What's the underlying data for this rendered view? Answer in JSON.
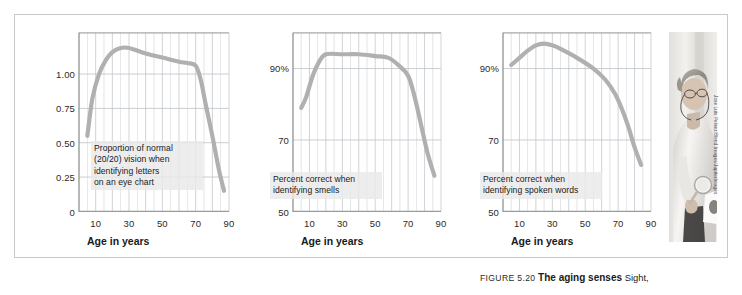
{
  "figure": {
    "caption_number": "FIGURE 5.20",
    "caption_title": "The aging senses",
    "caption_body": "Sight,",
    "photo_credit": "Jose Luis Pelaez/Blend Images/JupiterImages",
    "photo_alt": "older-woman-with-magnifier-photo",
    "grid_color": "#c4c8cc",
    "curve_color": "#b0b0b0",
    "frame_color": "#c9c9c9"
  },
  "chart_data": [
    {
      "id": "vision",
      "type": "line",
      "title": "",
      "annotation": "Proportion of normal\n(20/20) vision when\nidentifying letters\non an eye chart",
      "xlabel": "Age in years",
      "ylabel": "",
      "xlim": [
        0,
        90
      ],
      "ylim": [
        0,
        1.3
      ],
      "xticks": [
        10,
        30,
        50,
        70,
        90
      ],
      "xtick_labels": [
        "10",
        "30",
        "50",
        "70",
        "90"
      ],
      "yticks": [
        0,
        0.25,
        0.5,
        0.75,
        1.0
      ],
      "ytick_labels": [
        "0",
        "0.25",
        "0.50",
        "0.75",
        "1.00"
      ],
      "grid": true,
      "x": [
        5,
        8,
        12,
        16,
        20,
        25,
        30,
        40,
        50,
        60,
        65,
        70,
        73,
        76,
        80,
        84,
        87
      ],
      "y": [
        0.55,
        0.82,
        1.0,
        1.1,
        1.16,
        1.19,
        1.19,
        1.15,
        1.12,
        1.09,
        1.08,
        1.06,
        0.96,
        0.78,
        0.55,
        0.3,
        0.15
      ]
    },
    {
      "id": "smell",
      "type": "line",
      "title": "",
      "annotation": "Percent correct when\nidentifying smells",
      "xlabel": "Age in years",
      "ylabel": "",
      "xlim": [
        0,
        90
      ],
      "ylim": [
        50,
        100
      ],
      "xticks": [
        10,
        30,
        50,
        70,
        90
      ],
      "xtick_labels": [
        "10",
        "30",
        "50",
        "70",
        "90"
      ],
      "yticks": [
        50,
        70,
        90
      ],
      "ytick_labels": [
        "50",
        "70",
        "90%"
      ],
      "grid": true,
      "x": [
        5,
        8,
        12,
        16,
        20,
        30,
        40,
        50,
        58,
        64,
        70,
        74,
        78,
        82,
        86
      ],
      "y": [
        79,
        82,
        88,
        92,
        94,
        94,
        94,
        93.5,
        93,
        91,
        88,
        82,
        74,
        66,
        60
      ]
    },
    {
      "id": "hearing",
      "type": "line",
      "title": "",
      "annotation": "Percent correct when\nidentifying spoken words",
      "xlabel": "Age in years",
      "ylabel": "",
      "xlim": [
        0,
        90
      ],
      "ylim": [
        50,
        100
      ],
      "xticks": [
        10,
        30,
        50,
        70,
        90
      ],
      "xtick_labels": [
        "10",
        "30",
        "50",
        "70",
        "90"
      ],
      "yticks": [
        50,
        70,
        90
      ],
      "ytick_labels": [
        "50",
        "70",
        "90%"
      ],
      "grid": true,
      "x": [
        5,
        10,
        15,
        20,
        25,
        30,
        35,
        45,
        55,
        62,
        68,
        72,
        76,
        80,
        84
      ],
      "y": [
        91,
        93,
        95,
        96.5,
        97,
        96.5,
        95.5,
        93,
        90,
        87,
        83,
        79,
        74,
        68,
        63
      ]
    }
  ]
}
